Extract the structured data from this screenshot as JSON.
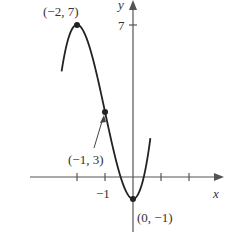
{
  "chart_data": {
    "type": "line",
    "title": "",
    "function": "y = 2x^3 + 6x^2 - 1",
    "xlabel": "x",
    "ylabel": "y",
    "x_ticks": [
      -2,
      -1,
      1,
      2
    ],
    "x_tick_labels": [
      "-1"
    ],
    "y_tick_labels": [
      "7"
    ],
    "xlim": [
      -2.5,
      2
    ],
    "ylim": [
      -1.5,
      8
    ],
    "grid": false,
    "points": [
      {
        "x": -2,
        "y": 7,
        "label": "(−2, 7)"
      },
      {
        "x": -1,
        "y": 3,
        "label": "(−1, 3)"
      },
      {
        "x": 0,
        "y": -1,
        "label": "(0, −1)"
      }
    ],
    "series": [
      {
        "name": "f(x)",
        "x": [
          -2.2,
          -2,
          -1.5,
          -1,
          -0.5,
          0,
          0.3,
          0.45
        ],
        "values": [
          5.74,
          7,
          5.75,
          3,
          0.25,
          -1,
          -0.406,
          0.4
        ]
      }
    ]
  },
  "labels": {
    "x_axis": "x",
    "y_axis": "y",
    "y_tick_7": "7",
    "x_tick_neg1": "−1",
    "pt_max": "(−2, 7)",
    "pt_mid": "(−1, 3)",
    "pt_min": "(0, −1)"
  }
}
